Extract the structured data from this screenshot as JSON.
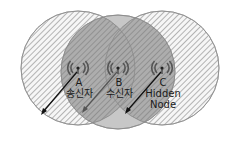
{
  "diagram": {
    "type": "hidden-node-problem",
    "colors": {
      "hatch": "#9a9a9a",
      "hatch_bg": "#f4f4f4",
      "middle_fill": "#b8b8b8",
      "outline": "#8a8a8a",
      "arrow": "#222222"
    },
    "nodes": [
      {
        "id": "A",
        "letter": "A",
        "role": "송신자",
        "cx": 78,
        "cy": 68,
        "r": 57
      },
      {
        "id": "B",
        "letter": "B",
        "role": "수신자",
        "cx": 118,
        "cy": 72,
        "r": 57
      },
      {
        "id": "C",
        "letter": "C",
        "role_line1": "Hidden",
        "role_line2": "Node",
        "cx": 162,
        "cy": 68,
        "r": 57
      }
    ]
  }
}
